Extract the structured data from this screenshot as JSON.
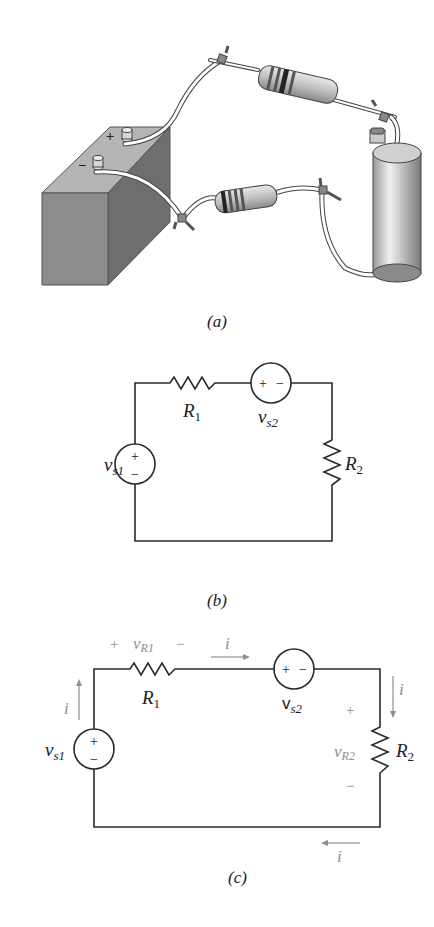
{
  "figure": {
    "panels": [
      {
        "id": "a",
        "caption": "(a)",
        "description": "Pictorial circuit: battery with + and - terminals connected by wires to two resistors and a cylindrical component",
        "battery": {
          "plus_label": "+",
          "minus_label": "−"
        }
      },
      {
        "id": "b",
        "caption": "(b)",
        "components": {
          "vs1": {
            "name": "v",
            "sub": "s1",
            "plus": "+",
            "minus": "−"
          },
          "r1": {
            "name": "R",
            "sub": "1"
          },
          "vs2": {
            "name": "v",
            "sub": "s2",
            "plus": "+",
            "minus": "−"
          },
          "r2": {
            "name": "R",
            "sub": "2"
          }
        }
      },
      {
        "id": "c",
        "caption": "(c)",
        "components": {
          "vs1": {
            "name": "v",
            "sub": "s1",
            "plus": "+",
            "minus": "−"
          },
          "r1": {
            "name": "R",
            "sub": "1"
          },
          "vs2": {
            "name": "v",
            "sub": "s2",
            "plus": "+",
            "minus": "−"
          },
          "r2": {
            "name": "R",
            "sub": "2"
          }
        },
        "annotations": {
          "vr1": {
            "plus": "+",
            "name": "v",
            "sub": "R1",
            "minus": "−"
          },
          "vr2": {
            "plus": "+",
            "name": "v",
            "sub": "R2",
            "minus": "−"
          },
          "current_label": "i"
        }
      }
    ],
    "colors": {
      "line": "#2a2a2a",
      "annotation": "#8f8f8f",
      "battery_front": "#8c8c8c",
      "battery_top": "#b5b5b5",
      "battery_side": "#6e6e6e"
    }
  }
}
